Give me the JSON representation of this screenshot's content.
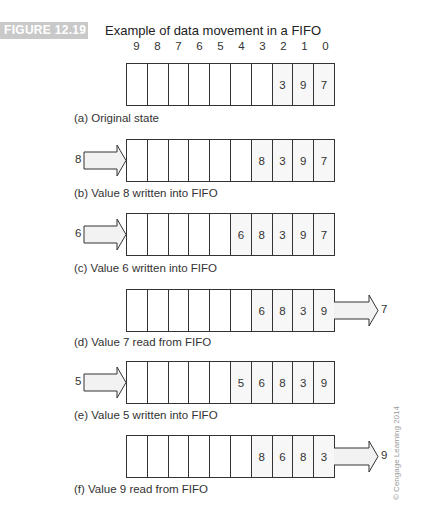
{
  "figure": {
    "label": "FIGURE 12.19",
    "title": "Example of data movement in a FIFO",
    "bit_positions": [
      "9",
      "8",
      "7",
      "6",
      "5",
      "4",
      "3",
      "2",
      "1",
      "0"
    ],
    "watermark": "© Cengage Learning 2014"
  },
  "colors": {
    "figure_label_bg": "#c9c9c9",
    "border": "#333333",
    "arrow_fill": "#f2f2f2"
  },
  "states": [
    {
      "id": "a",
      "caption": "(a) Original state",
      "cells": [
        "",
        "",
        "",
        "",
        "",
        "",
        "",
        "3",
        "9",
        "7"
      ],
      "input": null,
      "output": null
    },
    {
      "id": "b",
      "caption": "(b) Value 8 written into FIFO",
      "cells": [
        "",
        "",
        "",
        "",
        "",
        "",
        "8",
        "3",
        "9",
        "7"
      ],
      "input": "8",
      "output": null
    },
    {
      "id": "c",
      "caption": "(c) Value 6 written into FIFO",
      "cells": [
        "",
        "",
        "",
        "",
        "",
        "6",
        "8",
        "3",
        "9",
        "7"
      ],
      "input": "6",
      "output": null
    },
    {
      "id": "d",
      "caption": "(d) Value 7 read from FIFO",
      "cells": [
        "",
        "",
        "",
        "",
        "",
        "",
        "6",
        "8",
        "3",
        "9"
      ],
      "input": null,
      "output": "7"
    },
    {
      "id": "e",
      "caption": "(e) Value 5 written into FIFO",
      "cells": [
        "",
        "",
        "",
        "",
        "",
        "5",
        "6",
        "8",
        "3",
        "9"
      ],
      "input": "5",
      "output": null
    },
    {
      "id": "f",
      "caption": "(f) Value 9 read from FIFO",
      "cells": [
        "",
        "",
        "",
        "",
        "",
        "",
        "8",
        "6",
        "8",
        "3"
      ],
      "input": null,
      "output": "9"
    }
  ]
}
